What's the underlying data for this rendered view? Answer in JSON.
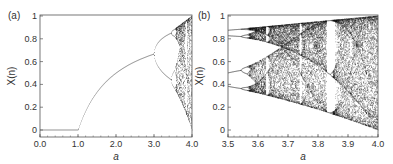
{
  "chart_data": [
    {
      "type": "scatter",
      "panel_label": "(a)",
      "title": "Logistic map bifurcation diagram",
      "xlabel": "a",
      "ylabel": "X(n)",
      "xlim": [
        0.0,
        4.0
      ],
      "ylim": [
        0,
        1
      ],
      "xticks": [
        "0.0",
        "1.0",
        "2.0",
        "3.0",
        "4.0"
      ],
      "yticks": [
        "0",
        "0.2",
        "0.4",
        "0.6",
        "0.8",
        "1"
      ],
      "grid": false,
      "description": "Fixed point x=0 for a<1, x=1-1/a for 1<a<3, period doubling at a=3, 3.449, chaos beyond ~3.57"
    },
    {
      "type": "scatter",
      "panel_label": "(b)",
      "title": "Logistic map bifurcation diagram (zoom)",
      "xlabel": "a",
      "ylabel": "X(n)",
      "xlim": [
        3.5,
        4.0
      ],
      "ylim": [
        0,
        1
      ],
      "xticks": [
        "3.5",
        "3.6",
        "3.7",
        "3.8",
        "3.9",
        "4.0"
      ],
      "yticks": [
        "0",
        "0.2",
        "0.4",
        "0.6",
        "0.8",
        "1"
      ],
      "grid": false,
      "description": "Period-4 cycle at a=3.5 bifurcating to chaos with periodic windows near a=3.63, 3.74, 3.83"
    }
  ]
}
